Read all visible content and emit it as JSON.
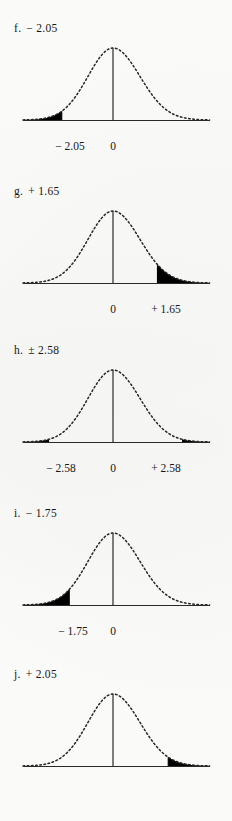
{
  "page": {
    "background_color": "#fdfdfc",
    "ink_color": "#171717",
    "fill_color": "#000000"
  },
  "panels": [
    {
      "id": "f",
      "letter": "f.",
      "value": "− 2.05",
      "label_full": "f.  − 2.05",
      "tail": "left",
      "z_values": [
        -2.05
      ],
      "ticks": [
        {
          "text": "− 2.05",
          "x": 70
        },
        {
          "text": "0",
          "x": 113
        }
      ]
    },
    {
      "id": "g",
      "letter": "g.",
      "value": "+ 1.65",
      "label_full": "g.  + 1.65",
      "tail": "right",
      "z_values": [
        1.65
      ],
      "ticks": [
        {
          "text": "0",
          "x": 113
        },
        {
          "text": "+ 1.65",
          "x": 166
        }
      ]
    },
    {
      "id": "h",
      "letter": "h.",
      "value": "± 2.58",
      "label_full": "h.  ± 2.58",
      "tail": "both",
      "z_values": [
        -2.58,
        2.58
      ],
      "ticks": [
        {
          "text": "− 2.58",
          "x": 61
        },
        {
          "text": "0",
          "x": 113
        },
        {
          "text": "+ 2.58",
          "x": 166
        }
      ]
    },
    {
      "id": "i",
      "letter": "i.",
      "value": "− 1.75",
      "label_full": "i.  − 1.75",
      "tail": "left",
      "z_values": [
        -1.75
      ],
      "ticks": [
        {
          "text": "− 1.75",
          "x": 73
        },
        {
          "text": "0",
          "x": 113
        }
      ]
    },
    {
      "id": "j",
      "letter": "j.",
      "value": "+ 2.05",
      "label_full": "j.  + 2.05",
      "tail": "right",
      "z_values": [
        2.05
      ],
      "ticks": []
    }
  ],
  "chart_data": {
    "type": "line",
    "title": "",
    "xlabel": "",
    "ylabel": "",
    "charts": [
      {
        "id": "f",
        "curve": "standard normal",
        "shaded_region": "left tail",
        "critical_values": [
          -2.05
        ],
        "tick_labels": [
          "− 2.05",
          "0"
        ],
        "x_axis_range": [
          -3.6,
          3.6
        ],
        "grid": false,
        "legend": "none"
      },
      {
        "id": "g",
        "curve": "standard normal",
        "shaded_region": "right tail",
        "critical_values": [
          1.65
        ],
        "tick_labels": [
          "0",
          "+ 1.65"
        ],
        "x_axis_range": [
          -3.6,
          3.6
        ],
        "grid": false,
        "legend": "none"
      },
      {
        "id": "h",
        "curve": "standard normal",
        "shaded_region": "both tails",
        "critical_values": [
          -2.58,
          2.58
        ],
        "tick_labels": [
          "− 2.58",
          "0",
          "+ 2.58"
        ],
        "x_axis_range": [
          -3.6,
          3.6
        ],
        "grid": false,
        "legend": "none"
      },
      {
        "id": "i",
        "curve": "standard normal",
        "shaded_region": "left tail",
        "critical_values": [
          -1.75
        ],
        "tick_labels": [
          "− 1.75",
          "0"
        ],
        "x_axis_range": [
          -3.6,
          3.6
        ],
        "grid": false,
        "legend": "none"
      },
      {
        "id": "j",
        "curve": "standard normal",
        "shaded_region": "right tail",
        "critical_values": [
          2.05
        ],
        "tick_labels": [],
        "x_axis_range": [
          -3.6,
          3.6
        ],
        "grid": false,
        "legend": "none"
      }
    ]
  }
}
